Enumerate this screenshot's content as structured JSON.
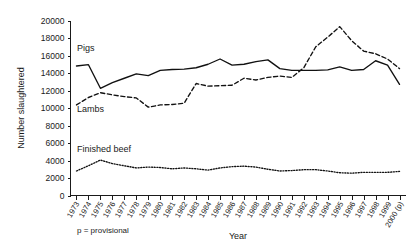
{
  "chart_data": {
    "type": "line",
    "title": "",
    "xlabel": "Year",
    "ylabel": "Number slaughtered",
    "ylim": [
      0,
      20000
    ],
    "ytick_step": 2000,
    "yticks": [
      "0",
      "2000",
      "4000",
      "6000",
      "8000",
      "10000",
      "12000",
      "14000",
      "16000",
      "18000",
      "20000"
    ],
    "grid": false,
    "legend_position": "inline-labels",
    "categories": [
      "1973",
      "1974",
      "1975",
      "1976",
      "1977",
      "1978",
      "1979",
      "1980",
      "1981",
      "1982",
      "1983",
      "1984",
      "1985",
      "1986",
      "1987",
      "1988",
      "1989",
      "1990",
      "1991",
      "1992",
      "1993",
      "1994",
      "1995",
      "1996",
      "1997",
      "1998",
      "1999",
      "2000 (p)"
    ],
    "series": [
      {
        "name": "Pigs",
        "style": "solid",
        "values": [
          14800,
          14950,
          12250,
          12900,
          13400,
          13900,
          13700,
          14300,
          14400,
          14450,
          14600,
          15000,
          15600,
          14900,
          15000,
          15300,
          15500,
          14500,
          14300,
          14300,
          14300,
          14350,
          14700,
          14300,
          14400,
          15400,
          14900,
          12700
        ]
      },
      {
        "name": "Lambs",
        "style": "dashed",
        "values": [
          10350,
          11200,
          11750,
          11500,
          11300,
          11150,
          10100,
          10350,
          10400,
          10550,
          12800,
          12500,
          12550,
          12600,
          13400,
          13200,
          13500,
          13650,
          13500,
          14600,
          17000,
          18100,
          19300,
          17700,
          16500,
          16200,
          15600,
          14500
        ]
      },
      {
        "name": "Finished beef",
        "style": "dotted",
        "values": [
          2800,
          3400,
          4050,
          3650,
          3400,
          3150,
          3250,
          3200,
          3050,
          3150,
          3050,
          2900,
          3150,
          3300,
          3350,
          3250,
          3000,
          2800,
          2850,
          2950,
          2950,
          2800,
          2600,
          2550,
          2650,
          2650,
          2650,
          2750
        ]
      }
    ],
    "annotations": [
      {
        "id": "note-provisional",
        "text": "p = provisional"
      }
    ]
  },
  "labels": {
    "pigs": "Pigs",
    "lambs": "Lambs",
    "finished_beef": "Finished beef",
    "y_axis_title": "Number slaughtered",
    "x_axis_title": "Year",
    "footnote": "p = provisional"
  },
  "colors": {
    "ink": "#1a1a1a",
    "series": "#111111",
    "background": "#ffffff"
  }
}
